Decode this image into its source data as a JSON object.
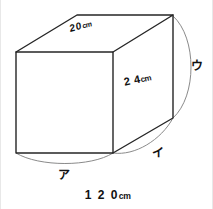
{
  "figure": {
    "kind": "geometry-diagram",
    "shape": "rectangular-prism",
    "background_color": "#ffffff",
    "edge_color": "#262626",
    "arc_color": "#8a8a8a",
    "text_color": "#111111",
    "dimension_labels": {
      "top_face": {
        "value": "20",
        "unit": "cm",
        "unit_superscript": "",
        "full": "20cm"
      },
      "right_face": {
        "value": "2 4",
        "unit": "cm",
        "unit_superscript": "",
        "full": "24cm"
      },
      "bottom_total": {
        "value": "1 2 0",
        "unit": "cm",
        "unit_superscript": "",
        "full": "120cm"
      }
    },
    "arc_markers": [
      {
        "id": "a",
        "label": "ア",
        "romaji": "a",
        "position": "bottom-front-edge"
      },
      {
        "id": "i",
        "label": "イ",
        "romaji": "i",
        "position": "bottom-right-depth-edge"
      },
      {
        "id": "u",
        "label": "ウ",
        "romaji": "u",
        "position": "right-back-vertical-edge"
      }
    ],
    "vertices": {
      "front_top_left": [
        15,
        52
      ],
      "front_top_right": [
        112,
        52
      ],
      "front_bottom_left": [
        15,
        153
      ],
      "front_bottom_right": [
        112,
        153
      ],
      "back_top_left": [
        76,
        15
      ],
      "back_top_right": [
        172,
        15
      ],
      "back_bottom_right": [
        172,
        118
      ]
    }
  }
}
